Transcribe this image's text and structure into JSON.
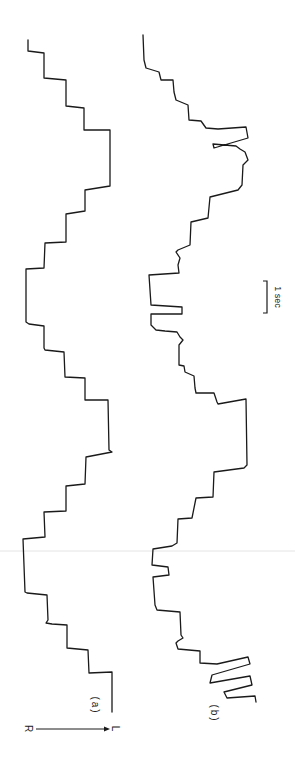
{
  "figure": {
    "orientation": "rotated 90 degrees (time runs top to bottom)",
    "background": "#ffffff",
    "trace_color": "#1a1a1a"
  },
  "labels": {
    "trace_a": "(a)",
    "trace_b": "(b)",
    "scale_bar": "1 sec",
    "direction_start": "R",
    "direction_end": "L"
  },
  "chart_data": {
    "type": "line",
    "title": "",
    "xlabel": "",
    "ylabel": "",
    "scale_bar": {
      "label": "1 sec",
      "pixel_length": 32
    },
    "series": [
      {
        "name": "(a)",
        "points": [
          [
            28,
            40
          ],
          [
            28,
            51
          ],
          [
            44,
            53
          ],
          [
            44,
            78
          ],
          [
            66,
            80
          ],
          [
            66,
            106
          ],
          [
            84,
            108
          ],
          [
            84,
            130
          ],
          [
            110,
            130
          ],
          [
            110,
            186
          ],
          [
            85,
            190
          ],
          [
            85,
            211
          ],
          [
            66,
            214
          ],
          [
            66,
            242
          ],
          [
            45,
            243
          ],
          [
            44,
            268
          ],
          [
            26,
            269
          ],
          [
            26,
            322
          ],
          [
            29,
            324
          ],
          [
            44,
            326
          ],
          [
            44,
            348
          ],
          [
            45,
            350
          ],
          [
            64,
            352
          ],
          [
            65,
            377
          ],
          [
            85,
            378
          ],
          [
            85,
            400
          ],
          [
            108,
            400
          ],
          [
            109,
            450
          ],
          [
            112,
            452
          ],
          [
            86,
            457
          ],
          [
            85,
            484
          ],
          [
            66,
            486
          ],
          [
            66,
            511
          ],
          [
            44,
            512
          ],
          [
            45,
            537
          ],
          [
            23,
            539
          ],
          [
            25,
            592
          ],
          [
            27,
            593
          ],
          [
            47,
            595
          ],
          [
            48,
            620
          ],
          [
            46,
            623
          ],
          [
            52,
            624
          ],
          [
            67,
            625
          ],
          [
            67,
            648
          ],
          [
            88,
            650
          ],
          [
            89,
            673
          ],
          [
            112,
            672
          ],
          [
            112,
            712
          ]
        ]
      },
      {
        "name": "(b)",
        "points": [
          [
            143,
            35
          ],
          [
            144,
            60
          ],
          [
            146,
            68
          ],
          [
            159,
            72
          ],
          [
            161,
            80
          ],
          [
            173,
            80
          ],
          [
            174,
            92
          ],
          [
            176,
            100
          ],
          [
            188,
            105
          ],
          [
            189,
            120
          ],
          [
            201,
            121
          ],
          [
            206,
            128
          ],
          [
            218,
            129
          ],
          [
            246,
            127
          ],
          [
            248,
            138
          ],
          [
            214,
            148
          ],
          [
            213,
            144
          ],
          [
            236,
            146
          ],
          [
            240,
            149
          ],
          [
            245,
            152
          ],
          [
            248,
            160
          ],
          [
            243,
            165
          ],
          [
            242,
            185
          ],
          [
            238,
            190
          ],
          [
            210,
            197
          ],
          [
            208,
            218
          ],
          [
            191,
            222
          ],
          [
            190,
            245
          ],
          [
            178,
            250
          ],
          [
            176,
            252
          ],
          [
            180,
            258
          ],
          [
            178,
            265
          ],
          [
            179,
            273
          ],
          [
            149,
            275
          ],
          [
            151,
            305
          ],
          [
            182,
            307
          ],
          [
            182,
            314
          ],
          [
            151,
            314
          ],
          [
            151,
            325
          ],
          [
            156,
            330
          ],
          [
            165,
            331
          ],
          [
            177,
            332
          ],
          [
            180,
            337
          ],
          [
            183,
            340
          ],
          [
            179,
            345
          ],
          [
            179,
            365
          ],
          [
            184,
            366
          ],
          [
            185,
            372
          ],
          [
            194,
            376
          ],
          [
            195,
            388
          ],
          [
            196,
            393
          ],
          [
            214,
            393
          ],
          [
            217,
            402
          ],
          [
            218,
            404
          ],
          [
            246,
            399
          ],
          [
            247,
            465
          ],
          [
            244,
            468
          ],
          [
            214,
            472
          ],
          [
            213,
            497
          ],
          [
            196,
            498
          ],
          [
            192,
            518
          ],
          [
            178,
            519
          ],
          [
            177,
            543
          ],
          [
            172,
            546
          ],
          [
            153,
            549
          ],
          [
            152,
            565
          ],
          [
            168,
            567
          ],
          [
            169,
            575
          ],
          [
            153,
            577
          ],
          [
            155,
            605
          ],
          [
            157,
            610
          ],
          [
            180,
            612
          ],
          [
            181,
            635
          ],
          [
            183,
            638
          ],
          [
            178,
            641
          ],
          [
            176,
            643
          ],
          [
            178,
            649
          ],
          [
            200,
            651
          ],
          [
            200,
            663
          ],
          [
            217,
            664
          ],
          [
            248,
            657
          ],
          [
            250,
            664
          ],
          [
            212,
            675
          ],
          [
            210,
            683
          ],
          [
            250,
            676
          ],
          [
            252,
            685
          ],
          [
            224,
            692
          ],
          [
            227,
            698
          ],
          [
            255,
            696
          ],
          [
            256,
            702
          ]
        ]
      }
    ],
    "legend": [],
    "grid": false
  }
}
